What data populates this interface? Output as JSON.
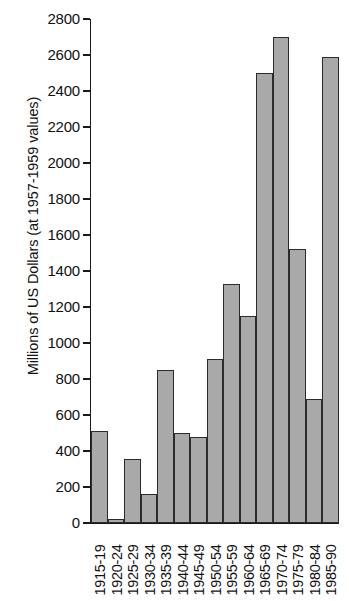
{
  "chart_data": {
    "type": "bar",
    "title": "",
    "subtitle": "",
    "xlabel": "",
    "ylabel": "Millions of US Dollars (at 1957-1959 values)",
    "categories": [
      "1915-19",
      "1920-24",
      "1925-29",
      "1930-34",
      "1935-39",
      "1940-44",
      "1945-49",
      "1950-54",
      "1955-59",
      "1960-64",
      "1965-69",
      "1970-74",
      "1975-79",
      "1980-84",
      "1985-90"
    ],
    "values": [
      510,
      20,
      355,
      160,
      850,
      500,
      480,
      910,
      1330,
      1150,
      2500,
      2700,
      1520,
      690,
      2590
    ],
    "ylim": [
      0,
      2800
    ],
    "yticks": [
      0,
      200,
      400,
      600,
      800,
      1000,
      1200,
      1400,
      1600,
      1800,
      2000,
      2200,
      2400,
      2600,
      2800
    ],
    "ytick_labels": [
      "0",
      "200",
      "400",
      "600",
      "800",
      "1000",
      "1200",
      "1400",
      "1600",
      "1800",
      "2000",
      "2200",
      "2400",
      "2600",
      "2800"
    ],
    "grid": false,
    "legend": [],
    "legend_position": "none",
    "bar_fill_color": "#a9a9a9",
    "bar_edge_color": "#2b2b2b",
    "axis_color": "#1a1a1a",
    "background_color": "#ffffff"
  }
}
